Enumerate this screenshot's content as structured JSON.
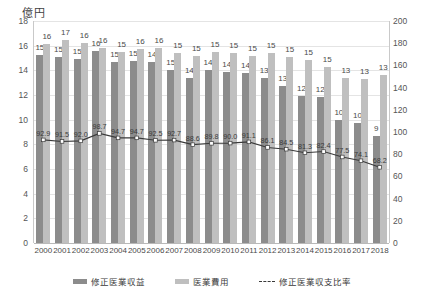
{
  "unit_label": "億円",
  "axes": {
    "left_ticks": [
      "18",
      "16",
      "14",
      "12",
      "10",
      "8",
      "6",
      "4",
      "2",
      "0"
    ],
    "right_ticks": [
      "200",
      "180",
      "160",
      "140",
      "120",
      "100",
      "80",
      "60",
      "40",
      "20",
      "0"
    ],
    "left_min": 0,
    "left_max": 18,
    "right_min": 0,
    "right_max": 200
  },
  "legend": {
    "items": [
      {
        "label": "修正医業収益",
        "marker": "revenue",
        "color": "#8c8c8c"
      },
      {
        "label": "医業費用",
        "marker": "expense",
        "color": "#bfbfbf"
      },
      {
        "label": "修正医業収支比率",
        "marker": "ratio",
        "color": "#3a3a3a"
      }
    ]
  },
  "chart_data": {
    "type": "bar",
    "title": "",
    "subtitle": "",
    "xlabel": "",
    "ylabel": "億円",
    "ylim": [
      0,
      18
    ],
    "y2lim": [
      0,
      200
    ],
    "grid": true,
    "legend_position": "bottom",
    "categories": [
      "2000",
      "2001",
      "2002",
      "2003",
      "2004",
      "2005",
      "2006",
      "2007",
      "2008",
      "2009",
      "2010",
      "2011",
      "2012",
      "2013",
      "2014",
      "2015",
      "2016",
      "2017",
      "2018"
    ],
    "series": [
      {
        "name": "修正医業収益",
        "type": "bar",
        "axis": "left",
        "color": "#8c8c8c",
        "values": [
          15,
          15,
          15,
          16,
          15,
          15,
          14,
          15,
          14,
          14,
          14,
          14,
          13,
          13,
          12,
          12,
          10,
          10,
          9
        ],
        "plot_values": [
          15.25,
          15.1,
          14.95,
          15.6,
          14.65,
          14.75,
          14.65,
          14.05,
          13.4,
          14.0,
          13.9,
          13.8,
          13.4,
          12.7,
          11.9,
          11.8,
          10.0,
          9.7,
          8.7
        ]
      },
      {
        "name": "医業費用",
        "type": "bar",
        "axis": "left",
        "color": "#bfbfbf",
        "values": [
          16,
          17,
          16,
          16,
          15,
          16,
          16,
          15,
          15,
          15,
          15,
          15,
          15,
          15,
          15,
          15,
          13,
          13,
          13
        ],
        "plot_values": [
          16.1,
          16.5,
          16.2,
          15.8,
          15.45,
          15.7,
          15.8,
          15.4,
          15.2,
          15.5,
          15.4,
          15.2,
          15.4,
          15.1,
          14.8,
          14.3,
          13.4,
          13.3,
          13.6
        ]
      },
      {
        "name": "修正医業収支比率",
        "type": "line",
        "axis": "right",
        "color": "#3a3a3a",
        "values": [
          92.9,
          91.5,
          92.0,
          98.7,
          94.7,
          94.7,
          92.5,
          92.7,
          88.6,
          89.8,
          90.0,
          91.1,
          86.1,
          84.5,
          81.3,
          82.4,
          77.5,
          74.1,
          68.2
        ]
      }
    ]
  }
}
